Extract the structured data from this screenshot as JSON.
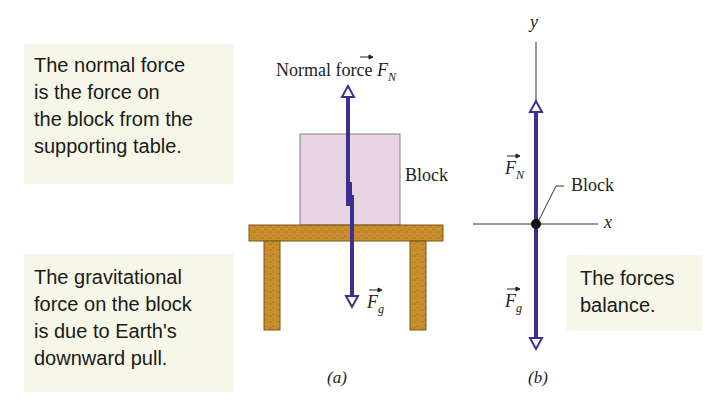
{
  "figure": {
    "callouts": {
      "normal_force": {
        "lines": [
          "The normal force",
          "is the force on",
          "the block from the",
          "supporting table."
        ]
      },
      "gravitational_force": {
        "lines": [
          "The gravitational",
          "force on the block",
          "is due to Earth's",
          "downward pull."
        ]
      },
      "balance": {
        "lines": [
          "The forces",
          "balance."
        ]
      }
    },
    "panel_a": {
      "normal_force_label": "Normal force",
      "fn_symbol": "F",
      "fn_subscript": "N",
      "block_label": "Block",
      "fg_symbol": "F",
      "fg_subscript": "g",
      "caption": "(a)"
    },
    "panel_b": {
      "y_axis_label": "y",
      "x_axis_label": "x",
      "fn_symbol": "F",
      "fn_subscript": "N",
      "fg_symbol": "F",
      "fg_subscript": "g",
      "block_label": "Block",
      "caption": "(b)"
    },
    "colors": {
      "callout_bg": "#f6f7e8",
      "arrow": "#3b2f8f",
      "block_fill": "#e7d5e3",
      "table_fill": "#c98f2e",
      "table_edge": "#7a5416",
      "axis": "#333333"
    }
  }
}
